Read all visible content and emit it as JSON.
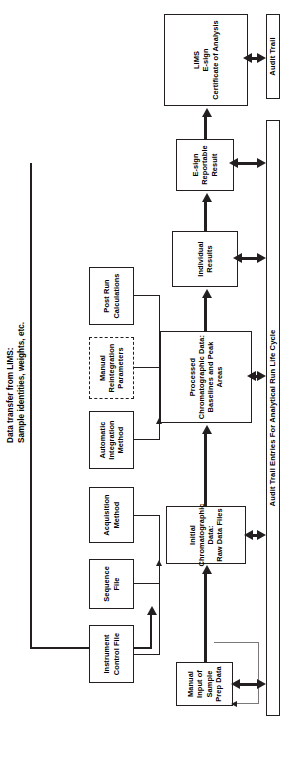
{
  "figure": {
    "title": "Audit Trail Entries For Analytical Run Life Cycle",
    "orientation": "landscape flowchart rotated 90 degrees counter-clockwise on a portrait page",
    "line_color": "#231f20",
    "background_color": "#ffffff"
  },
  "annotations": {
    "lims_transfer": "Data transfer from LIMS:\nSample identities, weights, etc."
  },
  "inputs": {
    "label": "Input / configuration objects",
    "items": [
      {
        "id": "instrument-control-file",
        "label": "Instrument\nControl File",
        "style": "solid"
      },
      {
        "id": "sequence-file",
        "label": "Sequence\nFile",
        "style": "solid"
      },
      {
        "id": "acquisition-method",
        "label": "Acquisition\nMethod",
        "style": "solid"
      },
      {
        "id": "automatic-integration-method",
        "label": "Automatic\nIntegration\nMethod",
        "style": "solid"
      },
      {
        "id": "manual-reintegration-parameters",
        "label": "Manual\nReintegration\nParameters",
        "style": "dashed"
      },
      {
        "id": "post-run-calculations",
        "label": "Post Run\nCalculations",
        "style": "solid"
      }
    ]
  },
  "pipeline": {
    "label": "Analytical data pipeline",
    "items": [
      {
        "id": "manual-input-sample-prep-data",
        "label": "Manual\nInput of\nSample\nPrep Data"
      },
      {
        "id": "initial-chromatographic-data",
        "label": "Initial\nChromatographic Data:\nRaw Data Files"
      },
      {
        "id": "processed-chromatographic-data",
        "label": "Processed\nChromatographic Data:\nBaselines and Peak Areas"
      },
      {
        "id": "individual-results",
        "label": "Individual\nResults"
      },
      {
        "id": "e-sign-reportable-result",
        "label": "E-sign\nReportable\nResult"
      },
      {
        "id": "lims-certificate-of-analysis",
        "label": "LIMS\nE-sign\nCertificate of Analysis"
      }
    ]
  },
  "audit": {
    "entries_box": "Audit Trail Entries For Analytical Run Life Cycle",
    "trail_box": "Audit Trail"
  }
}
